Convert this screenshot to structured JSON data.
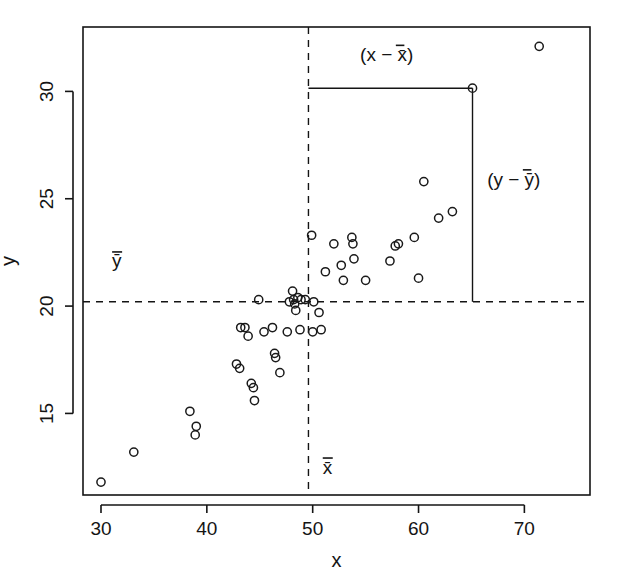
{
  "chart_data": {
    "type": "scatter",
    "title": "",
    "xlabel": "x",
    "ylabel": "y",
    "xlim": [
      28.3,
      76.2
    ],
    "ylim": [
      11.2,
      33.0
    ],
    "xticks": [
      30,
      40,
      50,
      60,
      70
    ],
    "yticks": [
      15,
      20,
      25,
      30
    ],
    "xtick_labels": [
      "30",
      "40",
      "50",
      "60",
      "70"
    ],
    "ytick_labels": [
      "15",
      "20",
      "25",
      "30"
    ],
    "grid": false,
    "legend": null,
    "marker": "open-circle",
    "marker_color": "#1a1a1a",
    "mean_x": 49.6,
    "mean_y": 20.2,
    "mean_line_style": "dashed",
    "highlighted_point": {
      "x": 65.1,
      "y": 30.15
    },
    "annotations": [
      {
        "name": "x-deviation-label",
        "text": "(x − x̄)",
        "x": 57.0,
        "y": 31.4
      },
      {
        "name": "y-deviation-label",
        "text": "(y − ȳ)",
        "x": 69.0,
        "y": 25.6
      },
      {
        "name": "x-mean-label",
        "text": "x̄",
        "x": 51.4,
        "y": 12.2
      },
      {
        "name": "y-mean-label",
        "text": "ȳ",
        "x": 31.5,
        "y": 21.8
      }
    ],
    "points": [
      {
        "x": 30.0,
        "y": 11.8
      },
      {
        "x": 33.1,
        "y": 13.2
      },
      {
        "x": 38.4,
        "y": 15.1
      },
      {
        "x": 39.0,
        "y": 14.4
      },
      {
        "x": 38.9,
        "y": 14.0
      },
      {
        "x": 42.8,
        "y": 17.3
      },
      {
        "x": 43.1,
        "y": 17.1
      },
      {
        "x": 43.2,
        "y": 19.0
      },
      {
        "x": 43.6,
        "y": 19.0
      },
      {
        "x": 43.9,
        "y": 18.6
      },
      {
        "x": 44.2,
        "y": 16.4
      },
      {
        "x": 44.4,
        "y": 16.2
      },
      {
        "x": 44.5,
        "y": 15.6
      },
      {
        "x": 44.9,
        "y": 20.3
      },
      {
        "x": 45.4,
        "y": 18.8
      },
      {
        "x": 46.2,
        "y": 19.0
      },
      {
        "x": 46.4,
        "y": 17.8
      },
      {
        "x": 46.5,
        "y": 17.6
      },
      {
        "x": 46.9,
        "y": 16.9
      },
      {
        "x": 47.6,
        "y": 18.8
      },
      {
        "x": 47.8,
        "y": 20.2
      },
      {
        "x": 48.1,
        "y": 20.7
      },
      {
        "x": 48.2,
        "y": 20.3
      },
      {
        "x": 48.3,
        "y": 20.1
      },
      {
        "x": 48.4,
        "y": 19.8
      },
      {
        "x": 48.6,
        "y": 20.4
      },
      {
        "x": 48.9,
        "y": 20.3
      },
      {
        "x": 48.8,
        "y": 18.9
      },
      {
        "x": 49.3,
        "y": 20.3
      },
      {
        "x": 49.9,
        "y": 23.3
      },
      {
        "x": 50.1,
        "y": 20.2
      },
      {
        "x": 50.0,
        "y": 18.8
      },
      {
        "x": 50.6,
        "y": 19.7
      },
      {
        "x": 50.8,
        "y": 18.9
      },
      {
        "x": 51.2,
        "y": 21.6
      },
      {
        "x": 52.0,
        "y": 22.9
      },
      {
        "x": 52.7,
        "y": 21.9
      },
      {
        "x": 52.9,
        "y": 21.2
      },
      {
        "x": 53.7,
        "y": 23.2
      },
      {
        "x": 53.8,
        "y": 22.9
      },
      {
        "x": 53.9,
        "y": 22.2
      },
      {
        "x": 55.0,
        "y": 21.2
      },
      {
        "x": 57.3,
        "y": 22.1
      },
      {
        "x": 57.8,
        "y": 22.8
      },
      {
        "x": 58.1,
        "y": 22.9
      },
      {
        "x": 59.6,
        "y": 23.2
      },
      {
        "x": 60.0,
        "y": 21.3
      },
      {
        "x": 60.5,
        "y": 25.8
      },
      {
        "x": 61.9,
        "y": 24.1
      },
      {
        "x": 63.2,
        "y": 24.4
      },
      {
        "x": 65.1,
        "y": 30.15
      },
      {
        "x": 71.4,
        "y": 32.1
      }
    ]
  },
  "figure": {
    "axis_color": "#141414",
    "background": "#ffffff"
  }
}
